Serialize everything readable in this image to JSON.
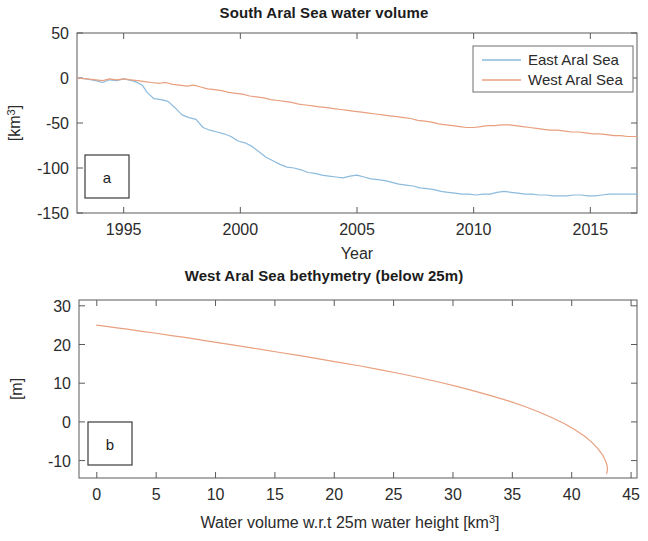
{
  "figure": {
    "panels": [
      {
        "tag": "a",
        "title": "South Aral Sea water volume",
        "xlabel": "Year",
        "ylabel_main": "[km",
        "ylabel_sup": "3",
        "ylabel_tail": "]"
      },
      {
        "tag": "b",
        "title": "West Aral Sea bethymetry (below 25m)",
        "xlabel_main": "Water volume w.r.t 25m water height [km",
        "xlabel_sup": "3",
        "xlabel_tail": "]",
        "ylabel": "[m]"
      }
    ]
  },
  "colors": {
    "east_aral_sea": "#8dbbdd",
    "west_aral_sea": "#e8a07f",
    "axis": "#5a5a5a",
    "text": "#2b2b2b"
  },
  "legend": {
    "position": "top-right",
    "entries": [
      {
        "label": "East Aral Sea",
        "color": "#8dbbdd"
      },
      {
        "label": "West Aral Sea",
        "color": "#e8a07f"
      }
    ]
  },
  "chart_data": [
    {
      "type": "line",
      "panel": "a",
      "title": "South Aral Sea water volume",
      "xlabel": "Year",
      "ylabel": "[km^3]",
      "xlim": [
        1993,
        2017
      ],
      "ylim": [
        -150,
        50
      ],
      "xticks": [
        1995,
        2000,
        2005,
        2010,
        2015
      ],
      "xtick_labels": [
        "1995",
        "2000",
        "2005",
        "2010",
        "2015"
      ],
      "yticks": [
        -150,
        -100,
        -50,
        0,
        50
      ],
      "ytick_labels": [
        "-150",
        "-100",
        "-50",
        "0",
        "50"
      ],
      "grid": false,
      "legend_position": "upper right",
      "series": [
        {
          "name": "East Aral Sea",
          "color": "#8dbbdd",
          "x": [
            1993.0,
            1993.4,
            1993.8,
            1994.1,
            1994.4,
            1994.7,
            1995.0,
            1995.2,
            1995.5,
            1995.8,
            1996.0,
            1996.3,
            1996.6,
            1996.9,
            1997.2,
            1997.5,
            1997.8,
            1998.1,
            1998.4,
            1998.7,
            1999.0,
            1999.3,
            1999.6,
            1999.9,
            2000.2,
            2000.5,
            2000.8,
            2001.1,
            2001.4,
            2001.7,
            2002.0,
            2002.3,
            2002.6,
            2002.9,
            2003.2,
            2003.5,
            2003.8,
            2004.1,
            2004.4,
            2004.7,
            2005.0,
            2005.3,
            2005.6,
            2005.9,
            2006.2,
            2006.5,
            2006.8,
            2007.1,
            2007.4,
            2007.7,
            2008.0,
            2008.3,
            2008.6,
            2008.9,
            2009.2,
            2009.5,
            2009.8,
            2010.1,
            2010.4,
            2010.7,
            2011.0,
            2011.3,
            2011.6,
            2011.9,
            2012.2,
            2012.5,
            2012.8,
            2013.1,
            2013.4,
            2013.7,
            2014.0,
            2014.3,
            2014.6,
            2014.9,
            2015.2,
            2015.5,
            2015.8,
            2016.1,
            2016.4,
            2016.7,
            2017.0
          ],
          "y": [
            0,
            -1,
            -3,
            -5,
            -2,
            -3,
            -1,
            -2,
            -4,
            -8,
            -16,
            -23,
            -24,
            -26,
            -33,
            -41,
            -44,
            -46,
            -55,
            -58,
            -60,
            -62,
            -65,
            -70,
            -72,
            -76,
            -82,
            -88,
            -92,
            -96,
            -99,
            -100,
            -102,
            -105,
            -106,
            -108,
            -109,
            -110,
            -111,
            -109,
            -108,
            -110,
            -112,
            -113,
            -114,
            -116,
            -118,
            -119,
            -120,
            -122,
            -123,
            -124,
            -126,
            -127,
            -128,
            -129,
            -129,
            -130,
            -129,
            -129,
            -127,
            -126,
            -127,
            -128,
            -129,
            -129,
            -130,
            -130,
            -131,
            -131,
            -131,
            -130,
            -130,
            -131,
            -131,
            -130,
            -129,
            -129,
            -129,
            -129,
            -129
          ]
        },
        {
          "name": "West Aral Sea",
          "color": "#e8a07f",
          "x": [
            1993.0,
            1993.4,
            1993.8,
            1994.1,
            1994.4,
            1994.7,
            1995.0,
            1995.3,
            1995.6,
            1995.9,
            1996.2,
            1996.5,
            1996.8,
            1997.1,
            1997.4,
            1997.7,
            1998.0,
            1998.3,
            1998.6,
            1998.9,
            1999.2,
            1999.5,
            1999.8,
            2000.1,
            2000.4,
            2000.7,
            2001.0,
            2001.3,
            2001.6,
            2001.9,
            2002.2,
            2002.5,
            2002.8,
            2003.1,
            2003.4,
            2003.7,
            2004.0,
            2004.3,
            2004.6,
            2004.9,
            2005.2,
            2005.5,
            2005.8,
            2006.1,
            2006.4,
            2006.7,
            2007.0,
            2007.3,
            2007.6,
            2007.9,
            2008.2,
            2008.5,
            2008.8,
            2009.1,
            2009.4,
            2009.7,
            2010.0,
            2010.3,
            2010.6,
            2010.9,
            2011.2,
            2011.5,
            2011.8,
            2012.1,
            2012.4,
            2012.7,
            2013.0,
            2013.3,
            2013.6,
            2013.9,
            2014.2,
            2014.5,
            2014.8,
            2015.1,
            2015.4,
            2015.7,
            2016.0,
            2016.3,
            2016.6,
            2017.0
          ],
          "y": [
            0,
            -1,
            -2,
            -3,
            -1,
            -2,
            -1,
            -2,
            -3,
            -4,
            -5,
            -6,
            -5,
            -7,
            -8,
            -9,
            -8,
            -10,
            -12,
            -13,
            -14,
            -16,
            -17,
            -18,
            -20,
            -21,
            -22,
            -24,
            -25,
            -26,
            -27,
            -29,
            -30,
            -31,
            -32,
            -33,
            -34,
            -35,
            -36,
            -37,
            -38,
            -39,
            -40,
            -41,
            -42,
            -43,
            -44,
            -45,
            -47,
            -48,
            -49,
            -51,
            -52,
            -53,
            -54,
            -55,
            -55,
            -54,
            -53,
            -53,
            -52,
            -52,
            -53,
            -54,
            -55,
            -56,
            -57,
            -58,
            -58,
            -59,
            -60,
            -60,
            -61,
            -62,
            -62,
            -63,
            -64,
            -64,
            -65,
            -65
          ]
        }
      ]
    },
    {
      "type": "line",
      "panel": "b",
      "title": "West Aral Sea bethymetry (below 25m)",
      "xlabel": "Water volume w.r.t 25m water height [km^3]",
      "ylabel": "[m]",
      "xlim": [
        -1.5,
        45.5
      ],
      "ylim": [
        -14.5,
        31.5
      ],
      "xticks": [
        0,
        5,
        10,
        15,
        20,
        25,
        30,
        35,
        40,
        45
      ],
      "xtick_labels": [
        "0",
        "5",
        "10",
        "15",
        "20",
        "25",
        "30",
        "35",
        "40",
        "45"
      ],
      "yticks": [
        -10,
        0,
        10,
        20,
        30
      ],
      "ytick_labels": [
        "-10",
        "0",
        "10",
        "20",
        "30"
      ],
      "grid": false,
      "series": [
        {
          "name": "West Aral Sea bathymetry",
          "color": "#e8a07f",
          "x": [
            0.0,
            0.8,
            1.7,
            2.7,
            3.8,
            5.0,
            6.3,
            7.7,
            9.1,
            10.6,
            12.1,
            13.7,
            15.3,
            17.0,
            18.7,
            20.4,
            22.1,
            23.8,
            25.5,
            27.2,
            28.8,
            30.4,
            31.9,
            33.4,
            34.8,
            36.1,
            37.3,
            38.4,
            39.4,
            40.3,
            41.1,
            41.7,
            42.2,
            42.6,
            42.85,
            43.0,
            43.0,
            42.95
          ],
          "y": [
            25.0,
            24.7,
            24.3,
            23.9,
            23.4,
            22.9,
            22.3,
            21.7,
            21.0,
            20.3,
            19.6,
            18.8,
            18.0,
            17.2,
            16.3,
            15.4,
            14.5,
            13.5,
            12.5,
            11.4,
            10.3,
            9.1,
            7.9,
            6.6,
            5.3,
            3.9,
            2.5,
            1.0,
            -0.5,
            -2.1,
            -3.7,
            -5.3,
            -6.9,
            -8.5,
            -10.1,
            -11.5,
            -12.6,
            -13.3
          ]
        }
      ]
    }
  ]
}
